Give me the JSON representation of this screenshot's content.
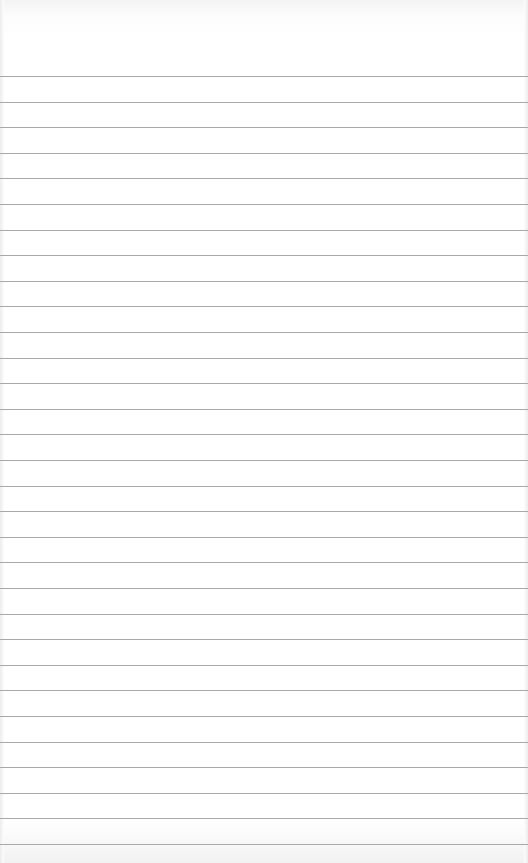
{
  "paper": {
    "type": "ruled-notebook-page",
    "background_color": "#ffffff",
    "line_color": "#a9a9a9",
    "first_line_y": 76,
    "line_spacing": 25.6,
    "line_count": 31
  }
}
